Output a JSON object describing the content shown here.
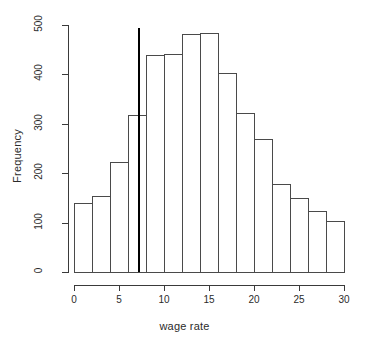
{
  "chart_data": {
    "type": "bar",
    "subtype": "histogram",
    "title": "",
    "xlabel": "wage rate",
    "ylabel": "Frequency",
    "xlim": [
      0,
      30
    ],
    "ylim": [
      0,
      500
    ],
    "grid": false,
    "legend": null,
    "bin_width": 2,
    "bin_edges": [
      0,
      2,
      4,
      6,
      8,
      10,
      12,
      14,
      16,
      18,
      20,
      22,
      24,
      26,
      28,
      30
    ],
    "categories": [
      "0-2",
      "2-4",
      "4-6",
      "6-8",
      "8-10",
      "10-12",
      "12-14",
      "14-16",
      "16-18",
      "18-20",
      "20-22",
      "22-24",
      "24-26",
      "26-28",
      "28-30"
    ],
    "values": [
      140,
      153,
      223,
      318,
      440,
      442,
      482,
      483,
      402,
      322,
      270,
      178,
      149,
      124,
      103
    ],
    "xticks": [
      0,
      5,
      10,
      15,
      20,
      25,
      30
    ],
    "xtick_labels": [
      "0",
      "5",
      "10",
      "15",
      "20",
      "25",
      "30"
    ],
    "yticks": [
      0,
      100,
      200,
      300,
      400,
      500
    ],
    "ytick_labels": [
      "0",
      "100",
      "200",
      "300",
      "400",
      "500"
    ],
    "annotations": [
      {
        "type": "vertical-line",
        "name": "reference-line",
        "x": 7.2,
        "color": "#000000"
      }
    ]
  }
}
